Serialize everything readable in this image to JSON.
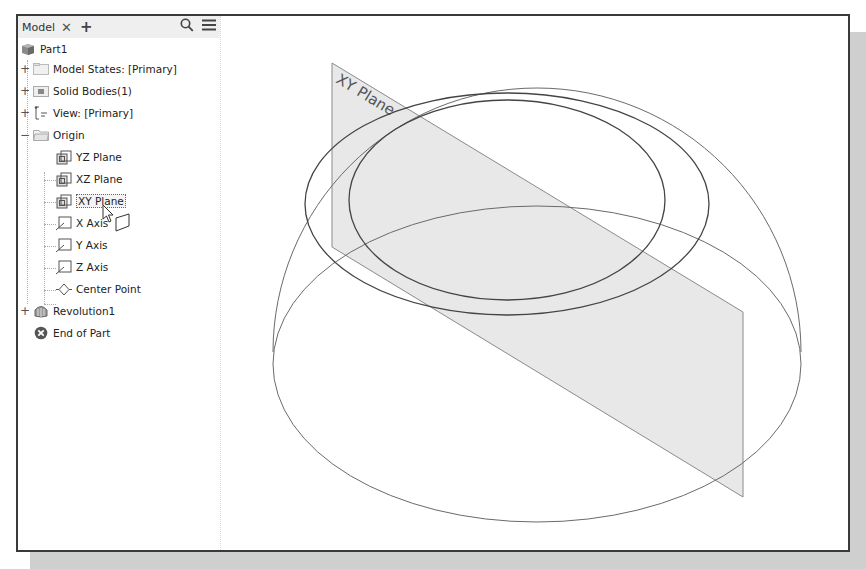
{
  "browser": {
    "tab_label": "Model",
    "close_icon": "close-icon",
    "add_icon": "plus-icon",
    "search_icon": "search-icon",
    "menu_icon": "hamburger-menu-icon",
    "tree": {
      "part": "Part1",
      "model_states": "Model States: [Primary]",
      "solid_bodies": "Solid Bodies(1)",
      "view": "View: [Primary]",
      "origin": "Origin",
      "yz_plane": "YZ Plane",
      "xz_plane": "XZ Plane",
      "xy_plane": "XY Plane",
      "x_axis": "X Axis",
      "y_axis": "Y Axis",
      "z_axis": "Z Axis",
      "center_point": "Center Point",
      "revolution": "Revolution1",
      "end_of_part": "End of Part"
    },
    "expanders": {
      "collapsed": "+",
      "expanded": "−"
    }
  },
  "viewport": {
    "plane_label": "XY Plane",
    "plane_fill": "#e6e6e6",
    "edge_color": "#555555"
  }
}
